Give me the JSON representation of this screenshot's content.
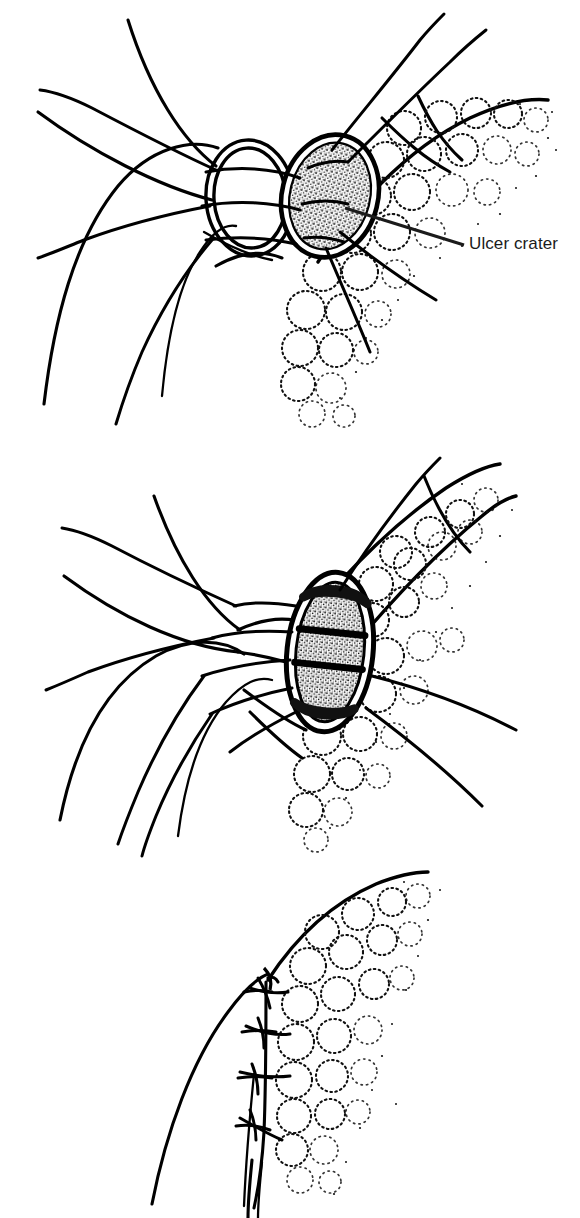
{
  "figure": {
    "width": 580,
    "height": 1218,
    "background_color": "#ffffff",
    "ink_color": "#000000"
  },
  "annotations": [
    {
      "id": "ulcer-crater",
      "text": "Ulcer crater",
      "panel": 1,
      "text_x": 469,
      "text_y": 234,
      "leader_from": [
        345,
        208
      ],
      "leader_to": [
        464,
        245
      ],
      "color": "#1b1b1b",
      "font_size": 17
    }
  ],
  "panels": [
    {
      "index": 1,
      "name": "perforation-with-sutures",
      "top": 0,
      "height": 440,
      "description": "Perforated ulcer crater with stay sutures placed across the defect and omentum adjacent",
      "elements": [
        "ulcer-crater-stipple",
        "perforation-rim-ellipse",
        "suture-threads",
        "omentum-lobules",
        "viscus-wall-contours"
      ]
    },
    {
      "index": 2,
      "name": "omental-patch-drawn-over",
      "top": 440,
      "height": 420,
      "description": "Omental tongue drawn across the perforation, sutures passing through the patch",
      "elements": [
        "omental-patch",
        "patch-stipple",
        "suture-threads",
        "omentum-lobules",
        "viscus-wall-contours"
      ]
    },
    {
      "index": 3,
      "name": "completed-repair-tied-sutures",
      "top": 860,
      "height": 358,
      "description": "Completed repair with three tied suture knots securing the omentum to the wall",
      "elements": [
        "tied-suture-knots",
        "omentum-lobules",
        "viscus-wall-contours"
      ]
    }
  ],
  "style": {
    "stroke_color": "#000000",
    "stipple_color": "#111111",
    "line_weight_main": 3.2,
    "line_weight_suture": 3.0,
    "line_weight_lobule": 2.0
  }
}
